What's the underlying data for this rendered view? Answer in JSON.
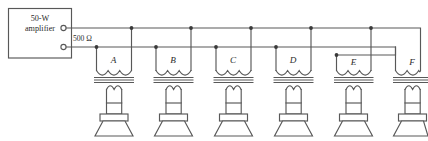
{
  "diagram": {
    "title_lines": [
      "50-W",
      "amplifier"
    ],
    "impedance_label": "500 Ω",
    "source": {
      "name": "amplifier-box",
      "label_line_1": "50-W",
      "label_line_2": "amplifier",
      "terminal_count": 2,
      "terminal_names": [
        "output-terminal-upper",
        "output-terminal-lower"
      ]
    },
    "bus": {
      "upper_line_name": "upper-bus-wire",
      "lower_line_name": "lower-bus-wire",
      "junction_count": 11
    },
    "units": [
      {
        "letter": "A",
        "transformer": "transformer-a",
        "speaker": "speaker-a"
      },
      {
        "letter": "B",
        "transformer": "transformer-b",
        "speaker": "speaker-b"
      },
      {
        "letter": "C",
        "transformer": "transformer-c",
        "speaker": "speaker-c"
      },
      {
        "letter": "D",
        "transformer": "transformer-d",
        "speaker": "speaker-d"
      },
      {
        "letter": "E",
        "transformer": "transformer-e",
        "speaker": "speaker-e"
      },
      {
        "letter": "F",
        "transformer": "transformer-f",
        "speaker": "speaker-f"
      }
    ],
    "colors": {
      "background": "#ffffff",
      "wire": "#585858",
      "text": "#2b2b2b",
      "node": "#3a3a3a"
    }
  }
}
